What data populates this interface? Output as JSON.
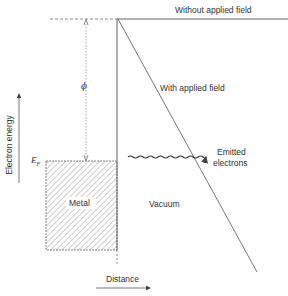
{
  "labels": {
    "without_field": "Without applied field",
    "with_field": "With applied field",
    "phi": "ϕ",
    "fermi": "E",
    "fermi_sub": "F",
    "emitted": "Emitted",
    "electrons": "electrons",
    "metal": "Metal",
    "vacuum": "Vacuum",
    "x_axis": "Distance",
    "y_axis": "Electron energy"
  },
  "colors": {
    "line": "#555555",
    "text": "#333333",
    "hatch": "#777777"
  }
}
